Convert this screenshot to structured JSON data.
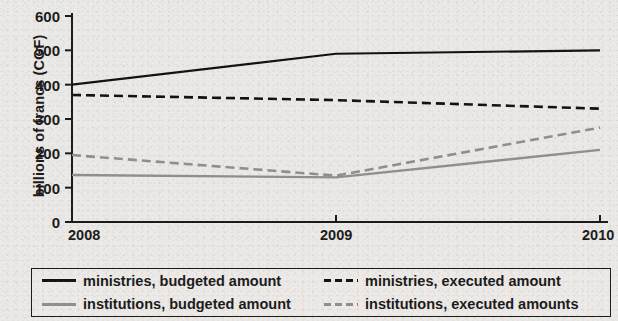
{
  "chart_data": {
    "type": "line",
    "title": "",
    "xlabel": "",
    "ylabel": "billions of francs (CGF)",
    "categories": [
      "2008",
      "2009",
      "2010"
    ],
    "x": [
      2008,
      2009,
      2010
    ],
    "xlim": [
      2008,
      2010
    ],
    "ylim": [
      0,
      600
    ],
    "yticks": [
      0,
      100,
      200,
      300,
      400,
      500,
      600
    ],
    "ytick_labels": [
      "0",
      "100",
      "200",
      "300",
      "400",
      "500",
      "600"
    ],
    "xtick_labels": [
      "2008",
      "2009",
      "2010"
    ],
    "grid": false,
    "legend_position": "below",
    "series": [
      {
        "name": "ministries, budgeted amount",
        "values": [
          400,
          490,
          500
        ],
        "color": "#111111",
        "style": "solid",
        "width": 2.2
      },
      {
        "name": "ministries, executed amount",
        "values": [
          370,
          355,
          330
        ],
        "color": "#111111",
        "style": "dashed",
        "width": 2.6
      },
      {
        "name": "institutions, budgeted amount",
        "values": [
          137,
          130,
          210
        ],
        "color": "#8f8f8f",
        "style": "solid",
        "width": 2.4
      },
      {
        "name": "institutions, executed amounts",
        "values": [
          195,
          135,
          275
        ],
        "color": "#8f8f8f",
        "style": "dashed",
        "width": 2.6
      }
    ]
  },
  "legend": {
    "entries": [
      {
        "label": "ministries, budgeted amount",
        "swatch": "sw-black-solid"
      },
      {
        "label": "ministries, executed amount",
        "swatch": "sw-black-dash"
      },
      {
        "label": "institutions, budgeted amount",
        "swatch": "sw-gray-solid"
      },
      {
        "label": "institutions, executed amounts",
        "swatch": "sw-gray-dash"
      }
    ]
  },
  "colors": {
    "ministries": "#111111",
    "institutions": "#8f8f8f",
    "axis": "#1a1a1a",
    "paper": "#ebe9e6"
  }
}
